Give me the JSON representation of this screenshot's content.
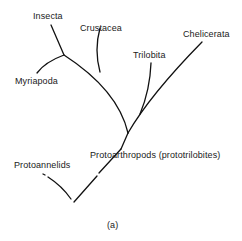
{
  "diagram": {
    "type": "phylogenetic-tree",
    "caption": "(a)",
    "labels": {
      "insecta": "Insecta",
      "crustacea": "Crustacea",
      "myriapoda": "Myriapoda",
      "trilobita": "Trilobita",
      "chelicerata": "Chelicerata",
      "protoarthropods": "Protoarthropods (prototrilobites)",
      "protoannelids": "Protoannelids"
    },
    "line_color": "#111111"
  }
}
